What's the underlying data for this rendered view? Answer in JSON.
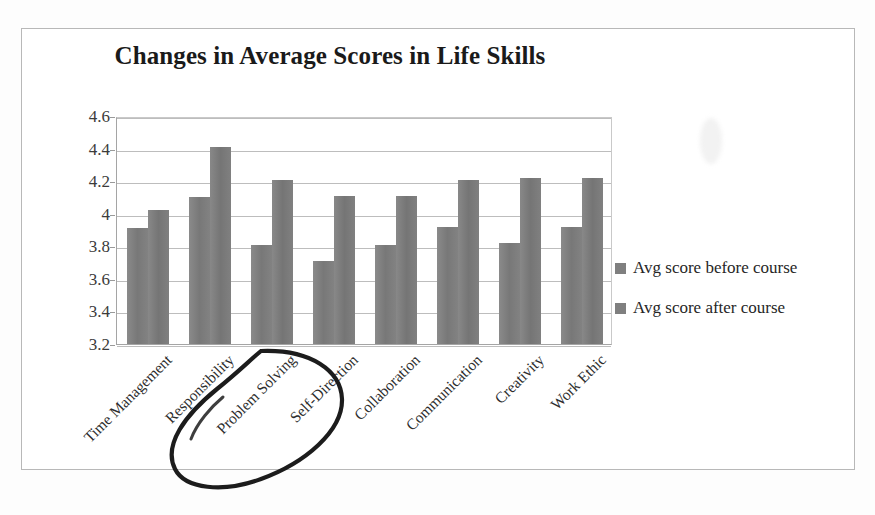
{
  "chart_data": {
    "type": "bar",
    "title": "Changes in Average Scores in Life Skills",
    "xlabel": "",
    "ylabel": "",
    "ylim": [
      3.2,
      4.6
    ],
    "ytick_step": 0.2,
    "yticks": [
      "4.6",
      "4.4",
      "4.2",
      "4",
      "3.8",
      "3.6",
      "3.4",
      "3.2"
    ],
    "grid": true,
    "legend_position": "right",
    "categories": [
      "Time Management",
      "Responsibility",
      "Problem Solving",
      "Self-Direction",
      "Collaboration",
      "Communication",
      "Creativity",
      "Work Ethic"
    ],
    "series": [
      {
        "name": "Avg score before course",
        "color": "#7f7f7f",
        "values": [
          3.91,
          4.1,
          3.81,
          3.71,
          3.81,
          3.92,
          3.82,
          3.92
        ]
      },
      {
        "name": "Avg score after course",
        "color": "#7f7f7f",
        "values": [
          4.02,
          4.41,
          4.21,
          4.11,
          4.11,
          4.21,
          4.22,
          4.22
        ]
      }
    ],
    "annotations": [
      {
        "type": "hand-drawn-ellipse",
        "target": "Problem Solving",
        "description": "Hand-drawn ink oval circling the Problem Solving axis label"
      }
    ]
  },
  "legend": {
    "items": [
      {
        "label": "Avg score before course",
        "swatch": "#7f7f7f"
      },
      {
        "label": "Avg score after course",
        "swatch": "#7f7f7f"
      }
    ]
  },
  "bottom_ghost_text": ""
}
